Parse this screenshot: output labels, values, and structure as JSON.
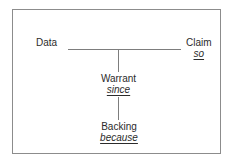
{
  "diagram": {
    "type": "toulmin-argument-model",
    "title": "",
    "background_color": "#ffffff",
    "border_color": "#8c8c8c",
    "line_color": "#7d7d7d",
    "text_color": "#2b2b2b",
    "nodes": {
      "data": {
        "term": "Data",
        "qualifier": ""
      },
      "claim": {
        "term": "Claim",
        "qualifier": "so"
      },
      "warrant": {
        "term": "Warrant",
        "qualifier": "since"
      },
      "backing": {
        "term": "Backing",
        "qualifier": "because"
      }
    },
    "connectors": [
      {
        "name": "data-to-claim",
        "orientation": "horizontal"
      },
      {
        "name": "claim-to-warrant",
        "orientation": "vertical"
      },
      {
        "name": "warrant-to-backing",
        "orientation": "vertical"
      }
    ]
  }
}
